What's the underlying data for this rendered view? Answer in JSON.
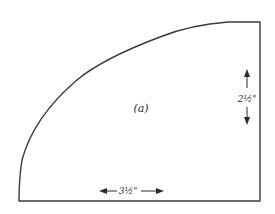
{
  "diagram": {
    "figure_label": "(a)",
    "dimensions": {
      "vertical": "2½\"",
      "horizontal": "3½\""
    },
    "shape": "quarter-round pattern piece: straight bottom and right edges, curved top-left edge",
    "colors": {
      "stroke": "#3a3a3a",
      "background": "#ffffff"
    }
  }
}
